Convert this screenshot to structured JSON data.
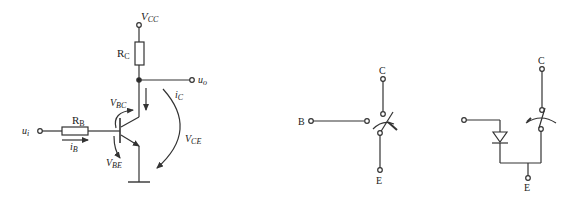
{
  "diagram": {
    "type": "circuit-schematic",
    "panels": [
      {
        "name": "bjt-common-emitter-circuit",
        "labels": {
          "vcc_main": "V",
          "vcc_sub": "CC",
          "rc_main": "R",
          "rc_sub": "C",
          "uo_main": "u",
          "uo_sub": "o",
          "ui_main": "u",
          "ui_sub": "i",
          "rb_main": "R",
          "rb_sub": "B",
          "ib_main": "i",
          "ib_sub": "B",
          "ic_main": "i",
          "ic_sub": "C",
          "vbc_main": "V",
          "vbc_sub": "BC",
          "vbe_main": "V",
          "vbe_sub": "BE",
          "vce_main": "V",
          "vce_sub": "CE"
        }
      },
      {
        "name": "switch-equivalent",
        "labels": {
          "collector": "C",
          "base": "B",
          "emitter": "E"
        }
      },
      {
        "name": "igbt-switch-equivalent-with-diode",
        "labels": {
          "collector": "C",
          "emitter": "E"
        }
      }
    ],
    "colors": {
      "stroke": "#333333",
      "background": "#ffffff"
    }
  }
}
